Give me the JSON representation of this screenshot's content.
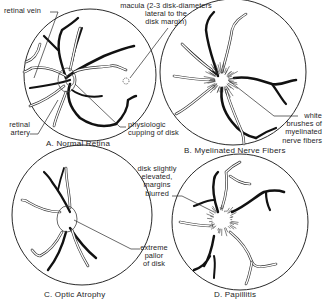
{
  "panels": [
    {
      "id": "A",
      "caption": "A. Normal Retina",
      "labels": [
        {
          "name": "retinal-vein-label",
          "text": "retinal vein"
        },
        {
          "name": "macula-label",
          "text": "macula (2-3 disk-diameters\nlateral to the\ndisk margin)"
        },
        {
          "name": "retinal-artery-label",
          "text": "retinal\nartery"
        },
        {
          "name": "physiologic-cupping-label",
          "text": "physiologic\ncupping of disk"
        }
      ]
    },
    {
      "id": "B",
      "caption": "B. Myelinated Nerve Fibers",
      "labels": [
        {
          "name": "white-brushes-label",
          "text": "white\nbrushes of\nmyelinated\nnerve fibers"
        }
      ]
    },
    {
      "id": "C",
      "caption": "C. Optic Atrophy",
      "labels": [
        {
          "name": "extreme-pallor-label",
          "text": "extreme\npallor\nof disk"
        }
      ]
    },
    {
      "id": "D",
      "caption": "D. Papillitis",
      "labels": [
        {
          "name": "disk-elevated-label",
          "text": "disk slightly\nelevated,\nmargins\nblurred"
        }
      ]
    }
  ]
}
